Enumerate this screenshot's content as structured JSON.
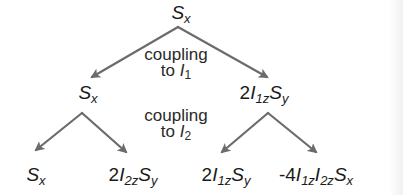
{
  "diagram": {
    "type": "coupling-evolution-tree",
    "arrow_color": "#6b6b6b",
    "root": {
      "label": "S_x",
      "base": "S",
      "sub": "x"
    },
    "level1_note": {
      "line1": "coupling",
      "line2_prefix": "to ",
      "spin": "I",
      "spin_sub": "1"
    },
    "level1": [
      {
        "label": "S_x",
        "coef": "",
        "parts": [
          {
            "b": "S",
            "s": "x"
          }
        ]
      },
      {
        "label": "2I_1z S_y",
        "coef": "2",
        "parts": [
          {
            "b": "I",
            "s": "1z"
          },
          {
            "b": "S",
            "s": "y"
          }
        ]
      }
    ],
    "level2_note": {
      "line1": "coupling",
      "line2_prefix": "to ",
      "spin": "I",
      "spin_sub": "2"
    },
    "level2": [
      {
        "label": "S_x",
        "coef": "",
        "parts": [
          {
            "b": "S",
            "s": "x"
          }
        ]
      },
      {
        "label": "2I_2z S_y",
        "coef": "2",
        "parts": [
          {
            "b": "I",
            "s": "2z"
          },
          {
            "b": "S",
            "s": "y"
          }
        ]
      },
      {
        "label": "2I_1z S_y",
        "coef": "2",
        "parts": [
          {
            "b": "I",
            "s": "1z"
          },
          {
            "b": "S",
            "s": "y"
          }
        ]
      },
      {
        "label": "-4I_1z I_2z S_x",
        "coef": "-4",
        "parts": [
          {
            "b": "I",
            "s": "1z"
          },
          {
            "b": "I",
            "s": "2z"
          },
          {
            "b": "S",
            "s": "x"
          }
        ]
      }
    ]
  }
}
